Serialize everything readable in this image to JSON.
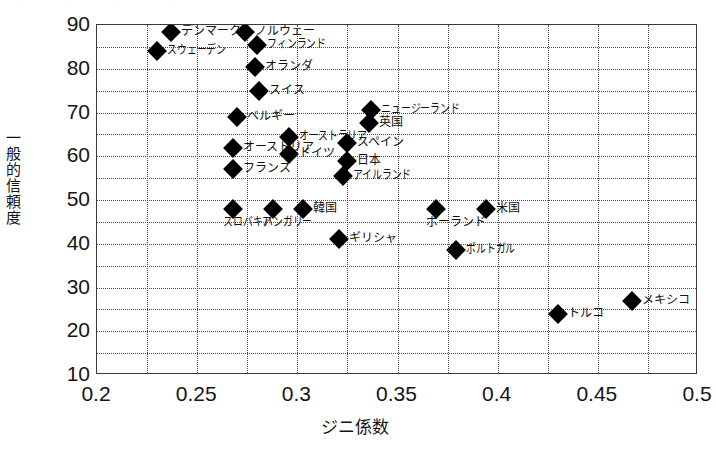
{
  "chart_data": {
    "type": "scatter",
    "title": "",
    "xlabel": "ジニ係数",
    "ylabel": "一般的信頼度",
    "xlim": [
      0.2,
      0.5
    ],
    "ylim": [
      10,
      90
    ],
    "xticks": [
      "0.2",
      "0.25",
      "0.3",
      "0.35",
      "0.4",
      "0.45",
      "0.5"
    ],
    "xtick_values": [
      0.2,
      0.25,
      0.3,
      0.35,
      0.4,
      0.45,
      0.5
    ],
    "yticks": [
      "10",
      "20",
      "30",
      "40",
      "50",
      "60",
      "70",
      "80",
      "90"
    ],
    "ytick_values": [
      10,
      20,
      30,
      40,
      50,
      60,
      70,
      80,
      90
    ],
    "x_minor_step": 0.025,
    "y_minor_step": 5,
    "grid": "minor dotted both axes",
    "legend": "none",
    "marker": "black diamond",
    "points": [
      {
        "label": "デンマーク",
        "x": 0.237,
        "y": 88.5,
        "label_pos": "right"
      },
      {
        "label": "ノルウェー",
        "x": 0.274,
        "y": 88.5,
        "label_pos": "right"
      },
      {
        "label": "スウェーデン",
        "x": 0.23,
        "y": 84.0,
        "label_pos": "right"
      },
      {
        "label": "フィンランド",
        "x": 0.28,
        "y": 85.5,
        "label_pos": "right"
      },
      {
        "label": "オランダ",
        "x": 0.279,
        "y": 80.5,
        "label_pos": "right"
      },
      {
        "label": "スイス",
        "x": 0.281,
        "y": 75.0,
        "label_pos": "right"
      },
      {
        "label": "ベルギー",
        "x": 0.27,
        "y": 69.0,
        "label_pos": "right"
      },
      {
        "label": "オーストラリア",
        "x": 0.296,
        "y": 64.5,
        "label_pos": "right"
      },
      {
        "label": "オーストリア",
        "x": 0.268,
        "y": 62.0,
        "label_pos": "right"
      },
      {
        "label": "ドイツ",
        "x": 0.296,
        "y": 60.5,
        "label_pos": "right"
      },
      {
        "label": "フランス",
        "x": 0.268,
        "y": 57.0,
        "label_pos": "right"
      },
      {
        "label": "ニュージーランド",
        "x": 0.337,
        "y": 70.5,
        "label_pos": "right"
      },
      {
        "label": "英国",
        "x": 0.336,
        "y": 67.5,
        "label_pos": "right"
      },
      {
        "label": "スペイン",
        "x": 0.325,
        "y": 63.0,
        "label_pos": "right"
      },
      {
        "label": "日本",
        "x": 0.325,
        "y": 59.0,
        "label_pos": "right"
      },
      {
        "label": "アイルランド",
        "x": 0.323,
        "y": 55.5,
        "label_pos": "right"
      },
      {
        "label": "スロバキア",
        "x": 0.268,
        "y": 48.0,
        "label_pos": "below"
      },
      {
        "label": "ハンガリー",
        "x": 0.288,
        "y": 48.0,
        "label_pos": "below"
      },
      {
        "label": "韓国",
        "x": 0.303,
        "y": 48.0,
        "label_pos": "right"
      },
      {
        "label": "ポーランド",
        "x": 0.369,
        "y": 48.0,
        "label_pos": "below"
      },
      {
        "label": "米国",
        "x": 0.394,
        "y": 48.0,
        "label_pos": "right"
      },
      {
        "label": "ギリシャ",
        "x": 0.321,
        "y": 41.0,
        "label_pos": "right"
      },
      {
        "label": "ポルトガル",
        "x": 0.379,
        "y": 38.5,
        "label_pos": "right"
      },
      {
        "label": "トルコ",
        "x": 0.43,
        "y": 24.0,
        "label_pos": "right"
      },
      {
        "label": "メキシコ",
        "x": 0.467,
        "y": 27.0,
        "label_pos": "right"
      }
    ]
  },
  "axes": {
    "x_title": "ジニ係数",
    "y_title_chars": [
      "一",
      "般",
      "的",
      "信",
      "頼",
      "度"
    ]
  },
  "colors": {
    "marker": "#000000",
    "axis_line": "#3a3a3a",
    "grid": "#4a4a4a",
    "text": "#141414",
    "background": "#ffffff"
  },
  "top_artifact": "· ·  · ·   · · · ·    · · ·  · · · · ·   · · ·"
}
